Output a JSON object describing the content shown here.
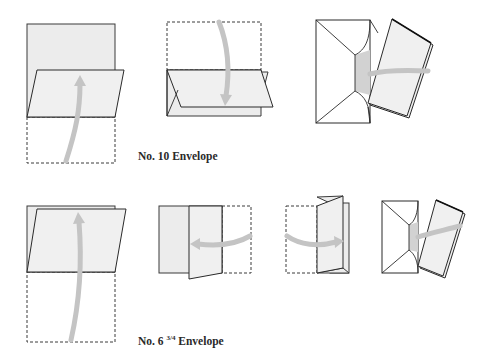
{
  "diagram": {
    "rows": [
      {
        "caption": "No. 10 Envelope",
        "steps": [
          {
            "id": "fold-bottom-up",
            "description": "Fold bottom third up"
          },
          {
            "id": "fold-top-down",
            "description": "Fold top third down"
          },
          {
            "id": "insert-into-envelope",
            "description": "Insert folded letter into envelope"
          }
        ]
      },
      {
        "caption_prefix": "No. 6",
        "caption_fraction": "3/4",
        "caption_suffix": "Envelope",
        "steps": [
          {
            "id": "fold-bottom-up",
            "description": "Fold bottom up"
          },
          {
            "id": "fold-right-left",
            "description": "Fold right side to left"
          },
          {
            "id": "fold-left-right",
            "description": "Fold left side to right"
          },
          {
            "id": "insert-into-envelope",
            "description": "Insert folded letter into envelope"
          }
        ]
      }
    ],
    "colors": {
      "paper": "#ececec",
      "outline": "#2a2a2a",
      "arrow": "#c4c4c4",
      "envelope_inner": "#d2d2d2"
    }
  }
}
